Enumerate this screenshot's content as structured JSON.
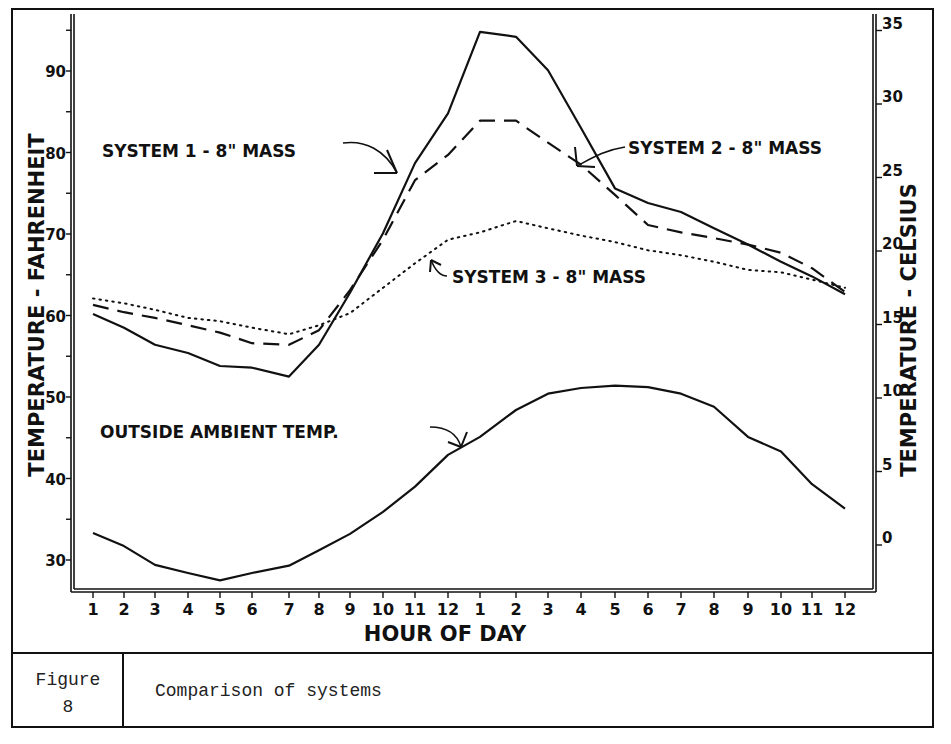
{
  "figure": {
    "number_label": "Figure",
    "number": "8",
    "caption": "Comparison of systems"
  },
  "chart_data": {
    "type": "line",
    "title": "",
    "xlabel": "HOUR OF DAY",
    "ylabel": "TEMPERATURE - FAHRENHEIT",
    "ylabel_right": "TEMPERATURE - CELSIUS",
    "grid": false,
    "x": [
      "1",
      "2",
      "3",
      "4",
      "5",
      "6",
      "7",
      "8",
      "9",
      "10",
      "11",
      "12",
      "1",
      "2",
      "3",
      "4",
      "5",
      "6",
      "7",
      "8",
      "9",
      "10",
      "11",
      "12"
    ],
    "ylim": [
      27,
      97
    ],
    "yticks_left": [
      30,
      40,
      50,
      60,
      70,
      80,
      90
    ],
    "yticks_right": [
      0,
      5,
      10,
      15,
      20,
      25,
      30,
      35
    ],
    "series": [
      {
        "name": "SYSTEM 1 - 8\" MASS",
        "style": "solid",
        "values": [
          60.2,
          58.5,
          56.4,
          55.4,
          53.8,
          53.6,
          52.5,
          56.4,
          62.8,
          70.1,
          78.7,
          84.8,
          94.8,
          94.2,
          90.1,
          83.0,
          75.6,
          73.8,
          72.7,
          70.7,
          68.7,
          66.6,
          64.8,
          62.6
        ]
      },
      {
        "name": "SYSTEM 2 - 8\" MASS",
        "style": "dashed",
        "values": [
          61.3,
          60.4,
          59.7,
          58.8,
          57.9,
          56.6,
          56.4,
          58.2,
          63.1,
          69.3,
          76.6,
          79.7,
          83.9,
          83.9,
          81.2,
          78.5,
          74.8,
          71.1,
          70.2,
          69.5,
          68.7,
          67.7,
          65.8,
          62.9
        ]
      },
      {
        "name": "SYSTEM 3 - 8\" MASS",
        "style": "dotted",
        "values": [
          62.1,
          61.5,
          60.7,
          59.7,
          59.3,
          58.5,
          57.7,
          58.8,
          60.3,
          63.4,
          66.4,
          69.3,
          70.2,
          71.6,
          70.7,
          69.8,
          69.0,
          68.0,
          67.4,
          66.6,
          65.6,
          65.3,
          64.4,
          63.4
        ]
      },
      {
        "name": "OUTSIDE AMBIENT TEMP.",
        "style": "solid",
        "values": [
          33.3,
          31.7,
          29.4,
          28.4,
          27.5,
          28.4,
          29.3,
          31.2,
          33.2,
          35.9,
          39.0,
          42.9,
          45.1,
          48.4,
          50.4,
          51.1,
          51.4,
          51.2,
          50.4,
          48.8,
          45.1,
          43.3,
          39.3,
          36.3
        ]
      }
    ],
    "annotations": [
      {
        "text": "SYSTEM 1 - 8\" MASS",
        "points_to_series": 0
      },
      {
        "text": "SYSTEM 2 - 8\" MASS",
        "points_to_series": 1
      },
      {
        "text": "SYSTEM 3 - 8\" MASS",
        "points_to_series": 2
      },
      {
        "text": "OUTSIDE AMBIENT TEMP.",
        "points_to_series": 3
      }
    ]
  }
}
